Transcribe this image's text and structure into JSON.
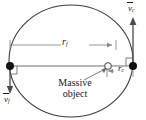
{
  "figure": {
    "name": "orbital-ellipse-diagram",
    "background": "#ffffff",
    "stroke_color": "#3c3c3c",
    "text_color": "#1a1a1a",
    "width": 146,
    "height": 120,
    "labels": {
      "r_f": {
        "symbol": "r",
        "subscript": "f"
      },
      "r_c": {
        "symbol": "r",
        "subscript": "c"
      },
      "v_c": {
        "symbol": "v",
        "subscript": "c"
      },
      "v_f": {
        "symbol": "v",
        "subscript": "f"
      },
      "massive_object_line1": "Massive",
      "massive_object_line2": "object"
    },
    "geometry": {
      "ellipse": {
        "cx": 71,
        "cy": 61,
        "rx": 62,
        "ry": 56
      },
      "far_point": {
        "x": 10,
        "y": 66
      },
      "close_point": {
        "x": 133,
        "y": 66
      },
      "focus": {
        "x": 108,
        "y": 66
      },
      "rf_dimension": {
        "x1": 10,
        "x2": 116,
        "y": 45
      },
      "rc_dimension": {
        "x1": 108,
        "x2": 133,
        "y": 71
      },
      "vc_arrow": {
        "x": 133,
        "y1": 62,
        "y2": 19,
        "direction": "up"
      },
      "vf_arrow": {
        "x": 10,
        "y1": 69,
        "y2": 93,
        "direction": "down"
      }
    }
  }
}
